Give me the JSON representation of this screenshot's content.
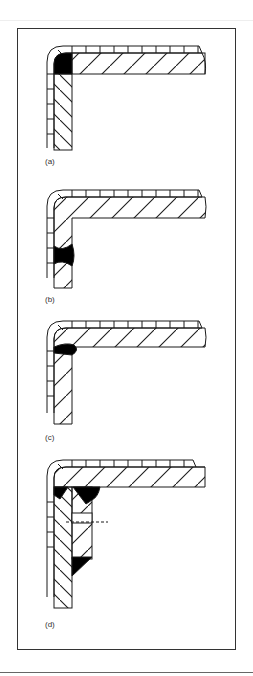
{
  "figure": {
    "panels": [
      {
        "id": "a",
        "label": "(a)",
        "weld": "corner fillet weld in inside of bend, between cladding and base plates"
      },
      {
        "id": "b",
        "label": "(b)",
        "weld": "butt weld across vertical leg"
      },
      {
        "id": "c",
        "label": "(c)",
        "weld": "weld bead under horizontal plate at junction"
      },
      {
        "id": "d",
        "label": "(d)",
        "weld": "double plate with fillet welds and dashed reference line"
      }
    ],
    "colors": {
      "line": "#1a1a1a",
      "frame": "#333333",
      "fill_weld": "#000000",
      "background": "#ffffff"
    }
  }
}
